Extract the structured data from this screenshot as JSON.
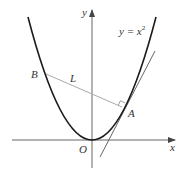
{
  "diagram": {
    "type": "geometry-figure",
    "curve": {
      "label": "y = x",
      "exponent": "2",
      "equation": "y = x^2"
    },
    "axes": {
      "x_label": "x",
      "y_label": "y",
      "origin_label": "O"
    },
    "points": {
      "A": "A",
      "B": "B"
    },
    "line_label": "L",
    "features": [
      "tangent line at A",
      "normal line L through A",
      "right-angle marker at A"
    ],
    "colors": {
      "curve": "#1a1a1a",
      "axes": "#555555",
      "tangent": "#555555",
      "normal": "#aaaaaa",
      "text": "#333333"
    }
  }
}
